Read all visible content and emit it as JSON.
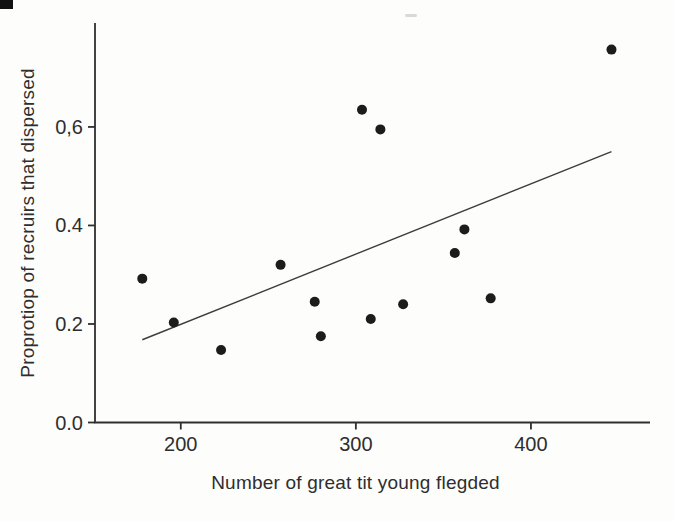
{
  "chart_data": {
    "type": "scatter",
    "title": "",
    "xlabel": "Number of great tit young flegded",
    "ylabel": "Proprotiop of recruirs that dispersed",
    "x_tick_values": [
      200,
      300,
      400
    ],
    "x_tick_labels": [
      "200",
      "300",
      "400"
    ],
    "y_tick_values": [
      0.0,
      0.2,
      0.4,
      0.6
    ],
    "y_tick_labels": [
      "0.0",
      "0.2",
      "0.4",
      "0,6"
    ],
    "xlim": [
      151,
      468
    ],
    "ylim": [
      0,
      0.811
    ],
    "grid": false,
    "legend": "none",
    "points": [
      {
        "x": 178,
        "y": 0.292
      },
      {
        "x": 196,
        "y": 0.203
      },
      {
        "x": 223,
        "y": 0.147
      },
      {
        "x": 257,
        "y": 0.32
      },
      {
        "x": 276.5,
        "y": 0.245
      },
      {
        "x": 280,
        "y": 0.175
      },
      {
        "x": 303.5,
        "y": 0.635
      },
      {
        "x": 308.5,
        "y": 0.21
      },
      {
        "x": 314,
        "y": 0.595
      },
      {
        "x": 327,
        "y": 0.24
      },
      {
        "x": 356.5,
        "y": 0.344
      },
      {
        "x": 362,
        "y": 0.392
      },
      {
        "x": 377,
        "y": 0.252
      },
      {
        "x": 446,
        "y": 0.757
      }
    ],
    "trend_line": {
      "x1": 178,
      "y1": 0.168,
      "x2": 446,
      "y2": 0.55
    },
    "point_color": "#1c1c1c",
    "line_color": "#3d3d3d",
    "axis_color": "#2f2f2f",
    "tick_text_color": "#2e2e2e",
    "point_radius": 5
  },
  "artifacts": {
    "corner_mark_color": "#111111",
    "top_dash_color": "#d9d9d9"
  }
}
